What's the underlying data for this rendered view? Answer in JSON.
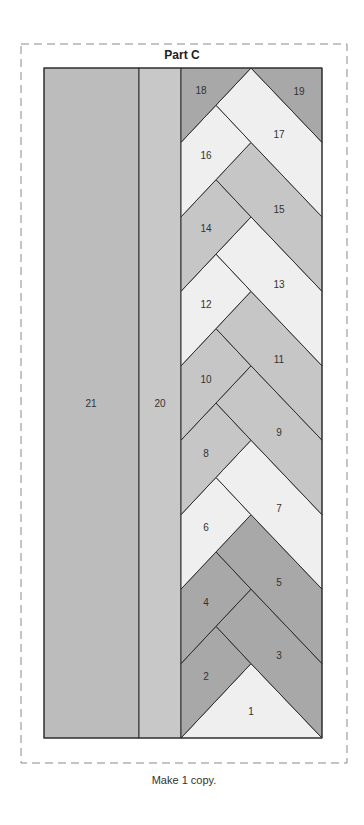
{
  "title": "Part C",
  "caption": "Make 1 copy.",
  "colors": {
    "dark": "#a8a8a8",
    "medium": "#c6c6c6",
    "light": "#efefef",
    "col21": "#bcbcbc",
    "col20": "#c8c8c8",
    "stroke": "#2f2f2f",
    "dash": "#8a8a8a"
  },
  "frame": {
    "x": 21,
    "y": 44,
    "w": 326,
    "h": 719
  },
  "pattern": {
    "top": 68,
    "bottom": 738,
    "x_col21": 44,
    "x_col20": 139,
    "x_braid_left": 181,
    "x_quarter": 216,
    "x_center": 251,
    "x_right": 322
  },
  "columns": [
    {
      "id": "21",
      "label": "21",
      "shade": "col21",
      "x0": 44,
      "x1": 139,
      "lx": 91,
      "ly": 404
    },
    {
      "id": "20",
      "label": "20",
      "shade": "col20",
      "x0": 139,
      "x1": 181,
      "lx": 160,
      "ly": 404
    }
  ],
  "pieces": [
    {
      "label": "1",
      "shade": "light",
      "lx": 251,
      "ly": 712
    },
    {
      "label": "2",
      "shade": "dark",
      "lx": 206,
      "ly": 677
    },
    {
      "label": "3",
      "shade": "dark",
      "lx": 279,
      "ly": 656
    },
    {
      "label": "4",
      "shade": "dark",
      "lx": 206,
      "ly": 603
    },
    {
      "label": "5",
      "shade": "dark",
      "lx": 279,
      "ly": 583
    },
    {
      "label": "6",
      "shade": "light",
      "lx": 206,
      "ly": 528
    },
    {
      "label": "7",
      "shade": "light",
      "lx": 279,
      "ly": 509
    },
    {
      "label": "8",
      "shade": "medium",
      "lx": 206,
      "ly": 454
    },
    {
      "label": "9",
      "shade": "medium",
      "lx": 279,
      "ly": 433
    },
    {
      "label": "10",
      "shade": "medium",
      "lx": 206,
      "ly": 380
    },
    {
      "label": "11",
      "shade": "medium",
      "lx": 279,
      "ly": 360
    },
    {
      "label": "12",
      "shade": "light",
      "lx": 206,
      "ly": 305
    },
    {
      "label": "13",
      "shade": "light",
      "lx": 279,
      "ly": 285
    },
    {
      "label": "14",
      "shade": "medium",
      "lx": 206,
      "ly": 229
    },
    {
      "label": "15",
      "shade": "medium",
      "lx": 279,
      "ly": 210
    },
    {
      "label": "16",
      "shade": "light",
      "lx": 206,
      "ly": 156
    },
    {
      "label": "17",
      "shade": "light",
      "lx": 279,
      "ly": 135
    },
    {
      "label": "18",
      "shade": "dark",
      "lx": 201,
      "ly": 91
    },
    {
      "label": "19",
      "shade": "dark",
      "lx": 299,
      "ly": 92
    }
  ]
}
